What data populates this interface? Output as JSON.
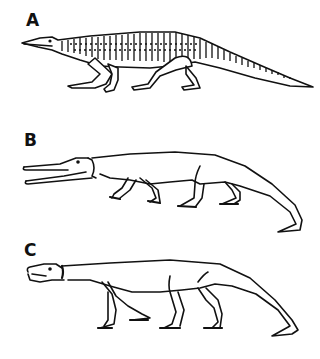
{
  "figure": {
    "panels": [
      {
        "label": "A",
        "description": "armored quadrupedal archosaur with dorsal scutes, low sprawling posture, long tapering tail"
      },
      {
        "label": "B",
        "description": "long-snouted open-jawed archosaur, smooth body, semi-erect limbs, curled tail tip"
      },
      {
        "label": "C",
        "description": "short-snouted archosaur, erect long limbs, long tail touching ground"
      }
    ]
  }
}
